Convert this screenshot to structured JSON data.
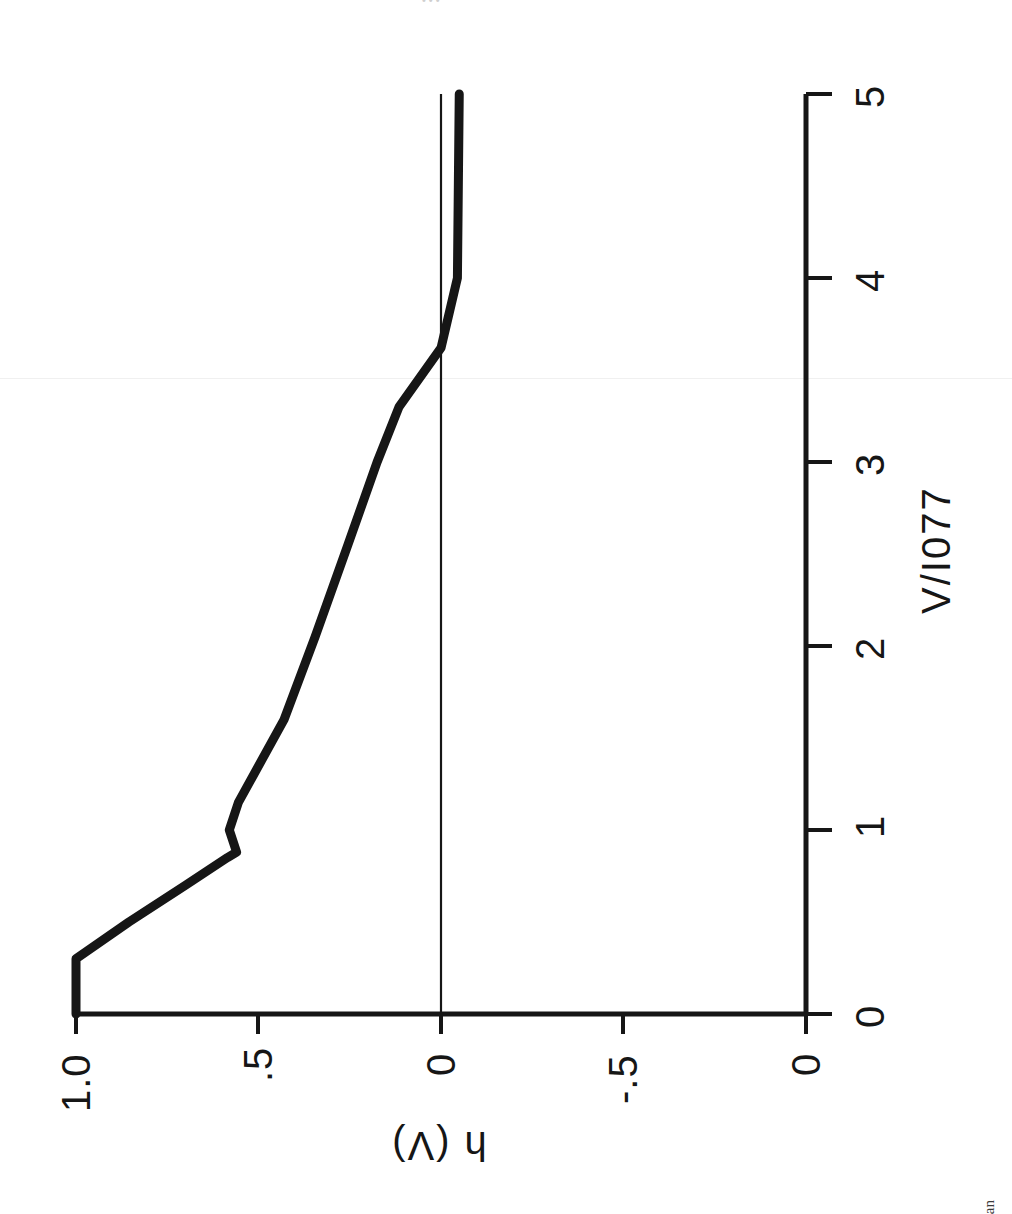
{
  "page": {
    "background": "#ffffff",
    "ink_color": "#161616",
    "orientation_note": "figure rotated 90 degrees clockwise on the scanned page",
    "top_caption": "•••",
    "stray_text": "an"
  },
  "chart_data": {
    "type": "line",
    "title": "",
    "subtitle": "",
    "xlabel": "V/I077",
    "ylabel": "h (V)",
    "xlim": [
      0,
      5
    ],
    "ylim": [
      -1.0,
      1.0
    ],
    "xticks": [
      0,
      1,
      2,
      3,
      4,
      5
    ],
    "xticklabels": [
      "0",
      "1",
      "2",
      "3",
      "4",
      "5"
    ],
    "yticks": [
      1.0,
      0.5,
      0,
      -0.5,
      -1.0
    ],
    "yticklabels": [
      "1.0",
      ".5",
      "0",
      "-.5",
      "0"
    ],
    "grid": false,
    "legend": null,
    "zero_reference_line": 0,
    "series": [
      {
        "name": "h(V)",
        "x": [
          0.0,
          0.3,
          0.5,
          0.7,
          0.85,
          0.88,
          1.0,
          1.15,
          1.6,
          2.05,
          2.55,
          3.0,
          3.3,
          3.62,
          4.0,
          5.0
        ],
        "y": [
          1.0,
          1.0,
          0.855,
          0.7,
          0.585,
          0.56,
          0.58,
          0.555,
          0.43,
          0.345,
          0.255,
          0.175,
          0.115,
          0.0,
          -0.045,
          -0.05
        ]
      }
    ]
  }
}
